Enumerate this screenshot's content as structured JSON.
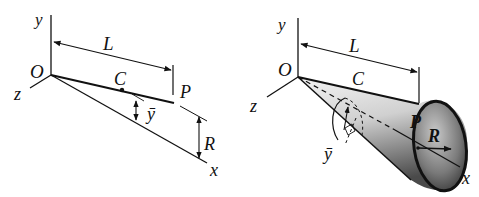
{
  "figure": {
    "left_panel": {
      "description": "Line segment O-P rotated about x-axis, centroid C",
      "labels": {
        "y_axis": "y",
        "z_axis": "z",
        "x_axis": "x",
        "origin": "O",
        "length": "L",
        "centroid": "C",
        "point": "P",
        "radius": "R",
        "ybar": "ȳ"
      }
    },
    "right_panel": {
      "description": "Cone generated by revolving line OP about x-axis",
      "labels": {
        "y_axis": "y",
        "z_axis": "z",
        "x_axis": "x",
        "origin": "O",
        "length": "L",
        "centroid": "C",
        "point": "P",
        "radius": "R",
        "ybar": "ȳ"
      }
    },
    "colors": {
      "ink": "#111111",
      "background": "#ffffff",
      "shade_dark": "#555555",
      "shade_light": "#f2f2f2"
    }
  }
}
